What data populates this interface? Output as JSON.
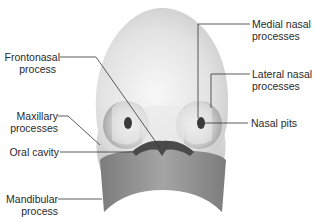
{
  "diagram": {
    "colors": {
      "head": "#e4e4e4",
      "head_highlight": "#f7f7f7",
      "maxillary": "#cfcfcf",
      "mandible": "#8e8e8e",
      "oral_cavity": "#4a4a4a",
      "nasal_pit": "#3a3a3a",
      "leader_line": "#333333",
      "text": "#2a2a2a"
    },
    "labels": {
      "frontonasal": {
        "line1": "Frontonasal",
        "line2": "process"
      },
      "maxillary": {
        "line1": "Maxillary",
        "line2": "processes"
      },
      "oral_cavity": {
        "line1": "Oral cavity"
      },
      "mandibular": {
        "line1": "Mandibular",
        "line2": "process"
      },
      "medial_nasal": {
        "line1": "Medial nasal",
        "line2": "processes"
      },
      "lateral_nasal": {
        "line1": "Lateral nasal",
        "line2": "processes"
      },
      "nasal_pits": {
        "line1": "Nasal pits"
      }
    }
  }
}
